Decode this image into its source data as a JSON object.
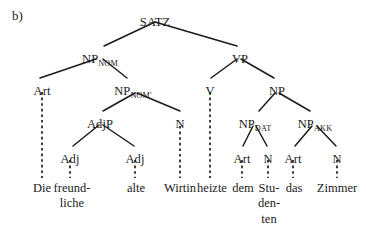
{
  "figure": {
    "panel_label": "b)",
    "width": 366,
    "height": 230,
    "ink_color": "#1a1a1a",
    "background_color": "#ffffff"
  },
  "nodes": [
    {
      "id": "satz",
      "base": "SATZ",
      "sub": "",
      "x": 155,
      "y": 16
    },
    {
      "id": "npnom",
      "base": "NP",
      "sub": "NOM",
      "x": 100,
      "y": 53
    },
    {
      "id": "vp",
      "base": "VP",
      "sub": "",
      "x": 240,
      "y": 53
    },
    {
      "id": "art1",
      "base": "Art",
      "sub": "",
      "x": 42,
      "y": 85
    },
    {
      "id": "npnombar",
      "base": "NP",
      "sub": "NOM'",
      "x": 133,
      "y": 85
    },
    {
      "id": "v",
      "base": "V",
      "sub": "",
      "x": 210,
      "y": 85
    },
    {
      "id": "np",
      "base": "NP",
      "sub": "",
      "x": 277,
      "y": 85
    },
    {
      "id": "adjp",
      "base": "AdjP",
      "sub": "",
      "x": 100,
      "y": 118
    },
    {
      "id": "n1",
      "base": "N",
      "sub": "",
      "x": 180,
      "y": 118
    },
    {
      "id": "npdat",
      "base": "NP",
      "sub": "DAT",
      "x": 255,
      "y": 118
    },
    {
      "id": "npakk",
      "base": "NP",
      "sub": "AKK",
      "x": 315,
      "y": 118
    },
    {
      "id": "adj1",
      "base": "Adj",
      "sub": "",
      "x": 70,
      "y": 153
    },
    {
      "id": "adj2",
      "base": "Adj",
      "sub": "",
      "x": 135,
      "y": 153
    },
    {
      "id": "art2",
      "base": "Art",
      "sub": "",
      "x": 242,
      "y": 153
    },
    {
      "id": "n2",
      "base": "N",
      "sub": "",
      "x": 268,
      "y": 153
    },
    {
      "id": "art3",
      "base": "Art",
      "sub": "",
      "x": 293,
      "y": 153
    },
    {
      "id": "n3",
      "base": "N",
      "sub": "",
      "x": 337,
      "y": 153
    }
  ],
  "branches": [
    {
      "from": "satz",
      "to": "npnom",
      "x1": 155,
      "y1": 22,
      "x2": 104,
      "y2": 46
    },
    {
      "from": "satz",
      "to": "vp",
      "x1": 155,
      "y1": 22,
      "x2": 237,
      "y2": 46
    },
    {
      "from": "npnom",
      "to": "art1",
      "x1": 96,
      "y1": 59,
      "x2": 40,
      "y2": 78
    },
    {
      "from": "npnom",
      "to": "npnombar",
      "x1": 103,
      "y1": 59,
      "x2": 127,
      "y2": 78
    },
    {
      "from": "vp",
      "to": "v",
      "x1": 237,
      "y1": 59,
      "x2": 211,
      "y2": 78
    },
    {
      "from": "vp",
      "to": "np",
      "x1": 241,
      "y1": 59,
      "x2": 274,
      "y2": 78
    },
    {
      "from": "npnombar",
      "to": "adjp",
      "x1": 135,
      "y1": 93,
      "x2": 103,
      "y2": 111
    },
    {
      "from": "npnombar",
      "to": "n1",
      "x1": 137,
      "y1": 93,
      "x2": 180,
      "y2": 111
    },
    {
      "from": "np",
      "to": "npdat",
      "x1": 275,
      "y1": 93,
      "x2": 259,
      "y2": 111
    },
    {
      "from": "np",
      "to": "npakk",
      "x1": 279,
      "y1": 93,
      "x2": 310,
      "y2": 111
    },
    {
      "from": "adjp",
      "to": "adj1",
      "x1": 99,
      "y1": 125,
      "x2": 73,
      "y2": 146
    },
    {
      "from": "adjp",
      "to": "adj2",
      "x1": 103,
      "y1": 125,
      "x2": 134,
      "y2": 146
    },
    {
      "from": "npdat",
      "to": "art2",
      "x1": 253,
      "y1": 126,
      "x2": 243,
      "y2": 146
    },
    {
      "from": "npdat",
      "to": "n2",
      "x1": 256,
      "y1": 126,
      "x2": 267,
      "y2": 146
    },
    {
      "from": "npakk",
      "to": "art3",
      "x1": 312,
      "y1": 126,
      "x2": 295,
      "y2": 146
    },
    {
      "from": "npakk",
      "to": "n3",
      "x1": 317,
      "y1": 126,
      "x2": 336,
      "y2": 146
    }
  ],
  "dashed_links": [
    {
      "from": "art1",
      "to": "die",
      "x": 42,
      "y1": 92,
      "y2": 178
    },
    {
      "from": "adj1",
      "to": "freund",
      "x": 70,
      "y1": 160,
      "y2": 178
    },
    {
      "from": "adj2",
      "to": "alte",
      "x": 135,
      "y1": 160,
      "y2": 178
    },
    {
      "from": "n1",
      "to": "wirtin",
      "x": 180,
      "y1": 126,
      "y2": 178
    },
    {
      "from": "v",
      "to": "heizte",
      "x": 210,
      "y1": 92,
      "y2": 178
    },
    {
      "from": "art2",
      "to": "dem",
      "x": 242,
      "y1": 160,
      "y2": 178
    },
    {
      "from": "n2",
      "to": "studenten",
      "x": 268,
      "y1": 160,
      "y2": 178
    },
    {
      "from": "art3",
      "to": "das",
      "x": 293,
      "y1": 160,
      "y2": 178
    },
    {
      "from": "n3",
      "to": "zimmer",
      "x": 337,
      "y1": 160,
      "y2": 178
    }
  ],
  "terminals": [
    {
      "id": "die",
      "lines": [
        "Die"
      ],
      "x": 42,
      "y": 181
    },
    {
      "id": "freund",
      "lines": [
        "freund-",
        "liche"
      ],
      "x": 72,
      "y": 181
    },
    {
      "id": "alte",
      "lines": [
        "alte"
      ],
      "x": 136,
      "y": 181
    },
    {
      "id": "wirtin",
      "lines": [
        "Wirtin"
      ],
      "x": 180,
      "y": 181
    },
    {
      "id": "heizte",
      "lines": [
        "heizte"
      ],
      "x": 212,
      "y": 181
    },
    {
      "id": "dem",
      "lines": [
        "dem"
      ],
      "x": 243,
      "y": 181
    },
    {
      "id": "studenten",
      "lines": [
        "Stu-",
        "den-",
        "ten"
      ],
      "x": 269,
      "y": 181
    },
    {
      "id": "das",
      "lines": [
        "das"
      ],
      "x": 294,
      "y": 181
    },
    {
      "id": "zimmer",
      "lines": [
        "Zimmer"
      ],
      "x": 337,
      "y": 181
    }
  ],
  "sentence": "Die freundliche alte Wirtin heizte dem Studenten das Zimmer"
}
